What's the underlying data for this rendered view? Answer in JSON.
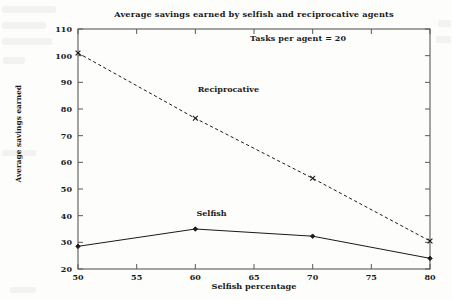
{
  "chart_data": {
    "type": "line",
    "title": "Average savings earned by selfish and reciprocative agents",
    "xlabel": "Selfish percentage",
    "ylabel": "Average savings earned",
    "annotation": "Tasks per agent = 20",
    "x": [
      50,
      60,
      70,
      80
    ],
    "xlim": [
      50,
      80
    ],
    "ylim": [
      20,
      110
    ],
    "xticks": [
      "50",
      "55",
      "60",
      "65",
      "70",
      "75",
      "80"
    ],
    "xtick_values": [
      50,
      55,
      60,
      65,
      70,
      75,
      80
    ],
    "yticks": [
      "20",
      "30",
      "40",
      "50",
      "60",
      "70",
      "80",
      "90",
      "100",
      "110"
    ],
    "ytick_values": [
      20,
      30,
      40,
      50,
      60,
      70,
      80,
      90,
      100,
      110
    ],
    "grid": false,
    "legend": "inline-labels",
    "series": [
      {
        "name": "Reciprocative",
        "values": [
          101,
          76.5,
          54,
          30.5
        ],
        "style": "dashed",
        "marker": "cross",
        "color": "#1a1a1a",
        "label_x": 60.2,
        "label_y": 87
      },
      {
        "name": "Selfish",
        "values": [
          28.5,
          35,
          32.3,
          24
        ],
        "style": "solid",
        "marker": "diamond",
        "color": "#1a1a1a",
        "label_x": 60.1,
        "label_y": 40.5
      }
    ]
  },
  "plot": {
    "frame_color": "#5a5a5a",
    "background": "#fdfdfb"
  }
}
